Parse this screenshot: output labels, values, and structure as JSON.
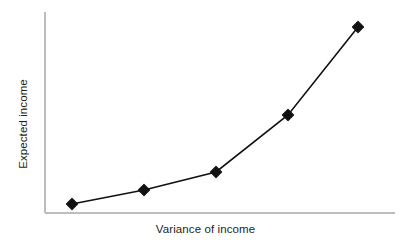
{
  "chart_data": {
    "type": "line",
    "title": "",
    "subtitle": "",
    "xlabel": "Variance of income",
    "ylabel": "Expected income",
    "x": [
      1,
      2,
      3,
      4,
      5
    ],
    "values": [
      4.5,
      11.4,
      20.4,
      48.8,
      92.5
    ],
    "series": [
      {
        "name": "Expected income",
        "values": [
          4.5,
          11.4,
          20.4,
          48.8,
          92.5
        ]
      }
    ],
    "xlim": [
      0,
      6
    ],
    "ylim": [
      0,
      100
    ],
    "grid": false,
    "legend": false,
    "legend_position": "none",
    "xticklabels": [],
    "yticklabels": [],
    "annotations": [],
    "marker": "diamond",
    "marker_size_px": 11,
    "line_width_px": 1.6,
    "colors": {
      "line": "#111111",
      "marker": "#111111",
      "axis": "#bdbdbd",
      "background": "#ffffff",
      "text": "#231f20"
    },
    "points_px": [
      {
        "x": 72,
        "y": 204
      },
      {
        "x": 144,
        "y": 190
      },
      {
        "x": 216,
        "y": 172
      },
      {
        "x": 288,
        "y": 115
      },
      {
        "x": 358,
        "y": 27
      }
    ],
    "axis_px": {
      "x_left": 45,
      "x_right": 395,
      "y_top": 12,
      "y_bottom": 213
    }
  }
}
